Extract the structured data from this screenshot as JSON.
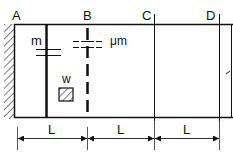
{
  "diagram": {
    "points": [
      {
        "id": "A",
        "label": "A"
      },
      {
        "id": "B",
        "label": "B"
      },
      {
        "id": "C",
        "label": "C"
      },
      {
        "id": "D",
        "label": "D"
      }
    ],
    "labels": {
      "m": "m",
      "mu_m": "μm",
      "w": "w"
    },
    "dimensions": [
      {
        "label": "L"
      },
      {
        "label": "L"
      },
      {
        "label": "L"
      }
    ],
    "colors": {
      "line": "#111111",
      "background": "#ffffff"
    }
  }
}
